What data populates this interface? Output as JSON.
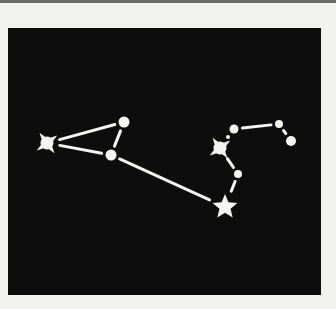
{
  "diagram": {
    "type": "constellation",
    "background_color": "#0d0d0d",
    "page_color": "#f2f2f0",
    "star_color": "#f4f4f0",
    "stars": [
      {
        "id": "s1",
        "shape": "burst",
        "x": 39,
        "y": 115,
        "r": 9
      },
      {
        "id": "s2",
        "shape": "circle",
        "x": 116,
        "y": 94,
        "r": 5.5
      },
      {
        "id": "s3",
        "shape": "circle",
        "x": 103,
        "y": 127,
        "r": 5.5
      },
      {
        "id": "s4",
        "shape": "star5",
        "x": 217,
        "y": 179,
        "r": 13
      },
      {
        "id": "s5",
        "shape": "burst",
        "x": 212,
        "y": 120,
        "r": 9
      },
      {
        "id": "s6",
        "shape": "circle",
        "x": 226,
        "y": 101,
        "r": 4.5
      },
      {
        "id": "s7",
        "shape": "circle",
        "x": 220,
        "y": 109,
        "r": 2
      },
      {
        "id": "s8",
        "shape": "circle",
        "x": 271,
        "y": 96,
        "r": 4
      },
      {
        "id": "s9",
        "shape": "circle",
        "x": 283,
        "y": 113,
        "r": 5
      },
      {
        "id": "s10",
        "shape": "circle",
        "x": 230,
        "y": 146,
        "r": 4
      }
    ],
    "lines": [
      {
        "from": "s1",
        "to": "s2"
      },
      {
        "from": "s1",
        "to": "s3"
      },
      {
        "from": "s2",
        "to": "s3"
      },
      {
        "from": "s3",
        "to": "s4"
      },
      {
        "from": "s4",
        "to": "s10"
      },
      {
        "from": "s10",
        "to": "s5"
      },
      {
        "from": "s6",
        "to": "s8"
      },
      {
        "from": "s8",
        "to": "s9"
      }
    ]
  }
}
